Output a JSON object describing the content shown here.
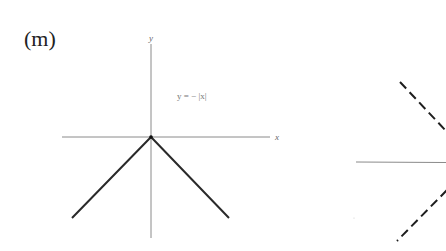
{
  "panel": {
    "label": "(m)"
  },
  "left_graph": {
    "equation": "y = − |x|",
    "x_axis_label": "x",
    "y_axis_label": "y",
    "vertex": [
      0,
      0
    ],
    "line_color": "#2a2a2a",
    "axis_color": "#8a8a8a"
  },
  "right_graph": {
    "line_style": "dashed",
    "line_color": "#1e1e1e",
    "axis_color": "#8a8a8a"
  }
}
